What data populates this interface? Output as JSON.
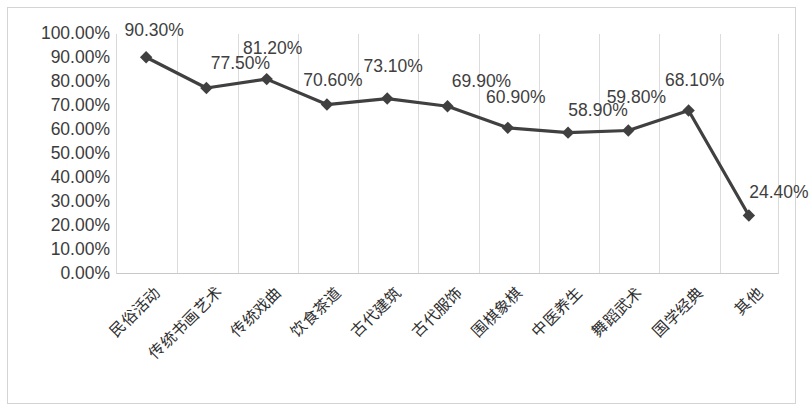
{
  "chart_data": {
    "type": "line",
    "title": "",
    "subtitle": "",
    "xlabel": "",
    "ylabel": "",
    "ylim": [
      0,
      100
    ],
    "ytick_labels": [
      "100.00%",
      "90.00%",
      "80.00%",
      "70.00%",
      "60.00%",
      "50.00%",
      "40.00%",
      "30.00%",
      "20.00%",
      "10.00%",
      "0.00%"
    ],
    "ytick_values": [
      100,
      90,
      80,
      70,
      60,
      50,
      40,
      30,
      20,
      10,
      0
    ],
    "grid": "vertical-only",
    "legend": "none",
    "marker": "diamond",
    "series_color": "#404040",
    "categories": [
      "民俗活动",
      "传统书画艺术",
      "传统戏曲",
      "饮食茶道",
      "古代建筑",
      "古代服饰",
      "围棋象棋",
      "中医养生",
      "舞蹈武术",
      "国学经典",
      "其他"
    ],
    "values": [
      90.3,
      77.5,
      81.2,
      70.6,
      73.1,
      69.9,
      60.9,
      58.9,
      59.8,
      68.1,
      24.4
    ],
    "data_labels": [
      "90.30%",
      "77.50%",
      "81.20%",
      "70.60%",
      "73.10%",
      "69.90%",
      "60.90%",
      "58.90%",
      "59.80%",
      "68.10%",
      "24.40%"
    ],
    "label_offsets_px": [
      {
        "dx": 8,
        "dy": -18
      },
      {
        "dx": 34,
        "dy": -16
      },
      {
        "dx": 6,
        "dy": -22
      },
      {
        "dx": 6,
        "dy": -16
      },
      {
        "dx": 6,
        "dy": -24
      },
      {
        "dx": 34,
        "dy": -16
      },
      {
        "dx": 8,
        "dy": -22
      },
      {
        "dx": 30,
        "dy": -14
      },
      {
        "dx": 8,
        "dy": -24
      },
      {
        "dx": 6,
        "dy": -22
      },
      {
        "dx": 30,
        "dy": -14
      }
    ]
  },
  "colors": {
    "series": "#404040",
    "frame": "#d4d4d4",
    "gridline": "#dcdcdc",
    "axis_text": "#3c3c3c",
    "label_text": "#404040",
    "background": "#ffffff"
  }
}
